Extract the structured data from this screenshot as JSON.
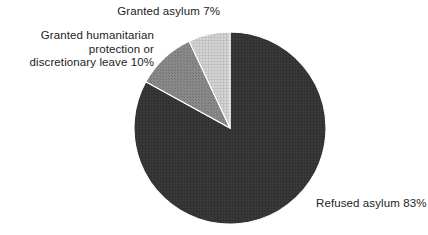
{
  "background_color": "#ffffff",
  "text_color": "#1d1d1d",
  "labels": {
    "granted_asylum": "Granted asylum 7%",
    "granted_humanitarian": "Granted humanitarian\nprotection or\ndiscretionary leave 10%",
    "refused_asylum": "Refused asylum 83%"
  },
  "chart_data": {
    "type": "pie",
    "title": "",
    "subtitle": "",
    "xlabel": "",
    "ylabel": "",
    "grid": false,
    "legend_position": "none",
    "labels_position": "outside-callout-text",
    "start_angle_deg": 0,
    "direction": "clockwise",
    "units": "percent",
    "total": 100,
    "center": {
      "x": 230,
      "y": 128
    },
    "radius": 97,
    "slices": [
      {
        "name": "Refused asylum",
        "label": "Refused asylum 83%",
        "value": 83,
        "color": "#3a3a3a",
        "texture": "fine-crosshatch",
        "start_deg": 0,
        "end_deg": 298.8
      },
      {
        "name": "Granted humanitarian protection or discretionary leave",
        "label": "Granted humanitarian protection or discretionary leave 10%",
        "value": 10,
        "color": "#8a8a8a",
        "texture": "fine-dot-grid",
        "start_deg": 298.8,
        "end_deg": 334.8
      },
      {
        "name": "Granted asylum",
        "label": "Granted asylum 7%",
        "value": 7,
        "color": "#d0d0d0",
        "texture": "fine-grid",
        "start_deg": 334.8,
        "end_deg": 360
      }
    ],
    "categories": [
      "Refused asylum",
      "Granted humanitarian protection or discretionary leave",
      "Granted asylum"
    ],
    "values": [
      83,
      10,
      7
    ]
  }
}
